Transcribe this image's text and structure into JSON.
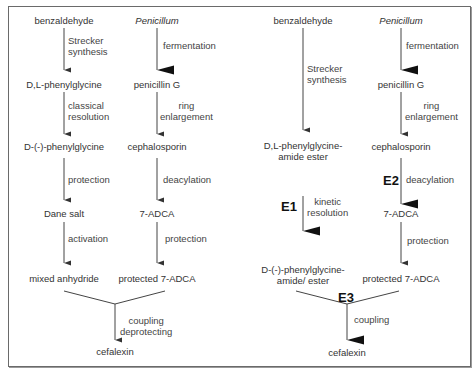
{
  "diagram": {
    "left_panel": {
      "chain_a": {
        "nodes": [
          "benzaldehyde",
          "D,L-phenylglycine",
          "D-(-)-phenylglycine",
          "Dane salt",
          "mixed anhydride"
        ],
        "steps": [
          [
            "Strecker",
            "synthesis"
          ],
          [
            "classical",
            "resolution"
          ],
          [
            "protection"
          ],
          [
            "activation"
          ]
        ]
      },
      "chain_b": {
        "nodes": [
          "Penicillum",
          "penicillin G",
          "cephalosporin",
          "7-ADCA",
          "protected 7-ADCA"
        ],
        "steps": [
          [
            "fermentation"
          ],
          [
            "ring",
            "enlargement"
          ],
          [
            "deacylation"
          ],
          [
            "protection"
          ]
        ]
      },
      "merge_step": [
        "coupling",
        "deprotecting"
      ],
      "product": "cefalexin"
    },
    "right_panel": {
      "chain_c": {
        "nodes": [
          "benzaldehyde",
          "D,L-phenylglycine-",
          "amide ester",
          "D-(-)-phenylglycine-",
          "amide/ ester"
        ],
        "steps": [
          [
            "Strecker",
            "synthesis"
          ],
          [
            "kinetic",
            "resolution"
          ]
        ],
        "enzyme": "E1"
      },
      "chain_d": {
        "nodes": [
          "Penicillum",
          "penicillin G",
          "cephalosporin",
          "7-ADCA",
          "protected 7-ADCA"
        ],
        "steps": [
          [
            "fermentation"
          ],
          [
            "ring",
            "enlargement"
          ],
          [
            "deacylation"
          ],
          [
            "protection"
          ]
        ],
        "enzyme": "E2"
      },
      "merge_enzyme": "E3",
      "merge_step": [
        "coupling"
      ],
      "product": "cefalexin"
    },
    "colors": {
      "line": "#3a3a3a",
      "text": "#333333",
      "frame": "#6a6a6a"
    }
  }
}
